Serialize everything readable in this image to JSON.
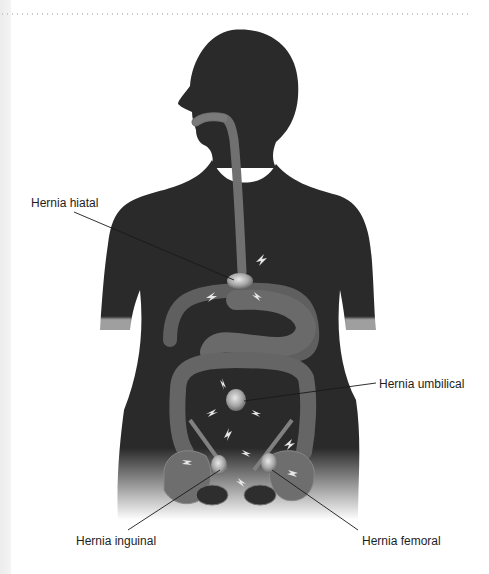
{
  "figure": {
    "palette": {
      "silhouette": "#2a2a2a",
      "organs": "#6a6a6a",
      "organ_highlight": "#9a9a9a",
      "hernia_bulge": "#c8c8c8",
      "pain_bolt": "#e6e6e6",
      "leader_line": "#1a1a1a",
      "label_text": "#1e1e1e",
      "border_dots": "#c9c9c9"
    },
    "labels": [
      {
        "id": "hiatal",
        "text": "Hernia hiatal",
        "x": 31,
        "y": 196
      },
      {
        "id": "umbilical",
        "text": "Hernia umbilical",
        "x": 379,
        "y": 377
      },
      {
        "id": "inguinal",
        "text": "Hernia inguinal",
        "x": 76,
        "y": 534
      },
      {
        "id": "femoral",
        "text": "Hernia femoral",
        "x": 362,
        "y": 534
      }
    ]
  }
}
